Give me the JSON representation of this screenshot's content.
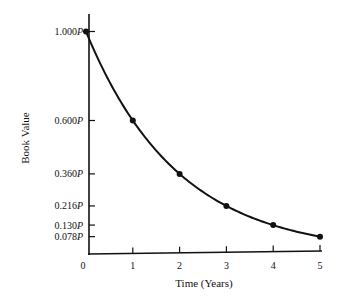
{
  "chart_data": {
    "type": "line",
    "title": "",
    "xlabel": "Time (Years)",
    "ylabel": "Book Value",
    "x": [
      0,
      1,
      2,
      3,
      4,
      5
    ],
    "x_tick_labels": [
      "0",
      "1",
      "2",
      "3",
      "4",
      "5"
    ],
    "y_tick_values": [
      1.0,
      0.6,
      0.36,
      0.216,
      0.13,
      0.078
    ],
    "y_tick_labels": [
      "1.000P",
      "0.600P",
      "0.360P",
      "0.216P",
      "0.130P",
      "0.078P"
    ],
    "series": [
      {
        "name": "Book Value",
        "values": [
          1.0,
          0.6,
          0.36,
          0.216,
          0.13,
          0.078
        ],
        "markers": true
      }
    ],
    "xlim": [
      0,
      5
    ],
    "ylim": [
      0,
      1.05
    ],
    "grid": false,
    "legend": "none",
    "line_color": "#111111"
  }
}
